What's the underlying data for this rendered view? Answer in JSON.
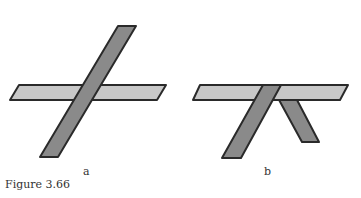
{
  "figure": {
    "caption": "Figure 3.66",
    "panels": [
      {
        "label": "a",
        "description": "Two strips crossing, diagonal strip passing over horizontal strip"
      },
      {
        "label": "b",
        "description": "Horizontal strip on top with two strips descending beneath"
      }
    ],
    "colors": {
      "horizontal_fill": "#c8c8c8",
      "diagonal_fill": "#8a8a8a",
      "stroke": "#2a2a2a"
    }
  }
}
